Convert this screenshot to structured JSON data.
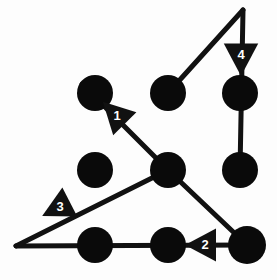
{
  "figure": {
    "canvas": {
      "width": 277,
      "height": 280,
      "background": "#fdfdfd"
    },
    "colors": {
      "stroke": "#111111",
      "node_fill": "#0a0a0a",
      "label_text": "#ffffff"
    },
    "nodes": [
      {
        "id": "node-top-left",
        "label": "1",
        "cx": 95,
        "cy": 93,
        "r": 18
      },
      {
        "id": "node-top-center",
        "label": "2",
        "cx": 168,
        "cy": 93,
        "r": 18
      },
      {
        "id": "node-top-right",
        "label": "3",
        "cx": 240,
        "cy": 93,
        "r": 18
      },
      {
        "id": "node-middle-left",
        "label": "4",
        "cx": 95,
        "cy": 170,
        "r": 18
      },
      {
        "id": "node-middle-center",
        "label": "5",
        "cx": 168,
        "cy": 170,
        "r": 18
      },
      {
        "id": "node-middle-right",
        "label": "6",
        "cx": 240,
        "cy": 170,
        "r": 18
      },
      {
        "id": "node-bottom-left",
        "label": "7",
        "cx": 95,
        "cy": 245,
        "r": 18
      },
      {
        "id": "node-bottom-center",
        "label": "8",
        "cx": 168,
        "cy": 245,
        "r": 18
      },
      {
        "id": "node-bottom-right",
        "label": "9",
        "cx": 247,
        "cy": 245,
        "r": 19
      }
    ],
    "segments": [
      {
        "id": "segment-1",
        "marker": "1",
        "from_x": 168,
        "from_y": 170,
        "to_x": 82,
        "to_y": 84,
        "direction": "up-left"
      },
      {
        "id": "segment-2",
        "marker": "2",
        "from_x": 247,
        "from_y": 245,
        "to_x": 16,
        "to_y": 246,
        "direction": "left"
      },
      {
        "id": "segment-3",
        "marker": "3",
        "from_x": 168,
        "from_y": 170,
        "to_x": 16,
        "to_y": 246,
        "direction": "down-left"
      },
      {
        "id": "segment-4",
        "marker": "4",
        "from_x": 168,
        "from_y": 93,
        "to_x": 243,
        "to_y": 10,
        "direction": "up-right"
      },
      {
        "id": "segment-5",
        "marker": "4",
        "from_x": 243,
        "from_y": 10,
        "to_x": 240,
        "to_y": 170,
        "direction": "down"
      },
      {
        "id": "segment-6",
        "marker": "2",
        "from_x": 168,
        "from_y": 170,
        "to_x": 247,
        "to_y": 245,
        "direction": "down-right"
      }
    ],
    "arrow_markers": [
      {
        "id": "arrow-marker-1",
        "label": "1",
        "x": 117,
        "y": 116,
        "angle": -135,
        "size": 20
      },
      {
        "id": "arrow-marker-2",
        "label": "2",
        "x": 205,
        "y": 245,
        "angle": 180,
        "size": 20
      },
      {
        "id": "arrow-marker-3",
        "label": "3",
        "x": 60,
        "y": 207,
        "angle": 153,
        "size": 20
      },
      {
        "id": "arrow-marker-4",
        "label": "4",
        "x": 241,
        "y": 55,
        "angle": 90,
        "size": 21
      }
    ]
  }
}
